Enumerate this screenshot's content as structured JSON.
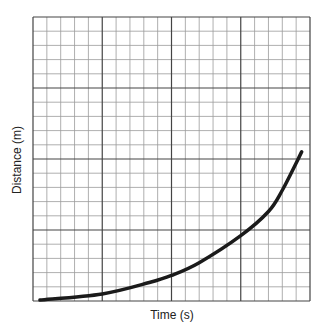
{
  "chart_data": {
    "type": "line",
    "title": "",
    "xlabel": "Time (s)",
    "ylabel": "Distance (m)",
    "grid": true,
    "grid_minor_divisions": 20,
    "grid_major_every": 5,
    "xlim": [
      0,
      20
    ],
    "ylim": [
      0,
      20
    ],
    "tick_labels_shown": false,
    "legend": null,
    "series": [
      {
        "name": "distance-vs-time",
        "x": [
          0.5,
          5,
          8.4,
          10,
          12,
          15,
          17,
          18,
          19.4
        ],
        "y": [
          0.07,
          0.5,
          1.3,
          1.8,
          2.7,
          4.6,
          6.3,
          7.8,
          10.5
        ]
      }
    ],
    "colors": {
      "curve": "#1a1a1a",
      "major_grid": "#444444",
      "minor_grid": "#9a9a9a"
    }
  },
  "labels": {
    "x_axis": "Time (s)",
    "y_axis": "Distance (m)"
  }
}
